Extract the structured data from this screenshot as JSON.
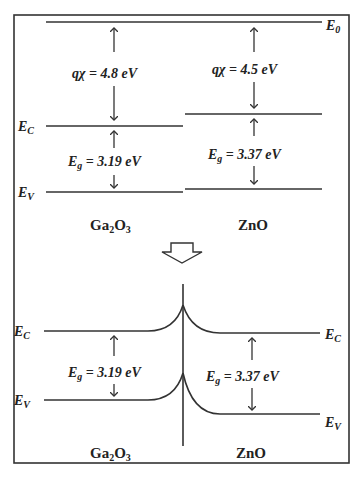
{
  "figure": {
    "type": "energy band diagram",
    "top_panel": {
      "vacuum_level_label": "E",
      "vacuum_level_sub": "0",
      "left_material": {
        "name_main": "Ga",
        "name_sub1": "2",
        "name_mid": "O",
        "name_sub2": "3",
        "electron_affinity_label": "qχ = 4.8 eV",
        "bandgap_label_E": "E",
        "bandgap_label_sub": "g",
        "bandgap_value": " = 3.19 eV",
        "ec_label": "E",
        "ec_sub": "C",
        "ev_label": "E",
        "ev_sub": "V"
      },
      "right_material": {
        "name": "ZnO",
        "electron_affinity_label": "qχ = 4.5 eV",
        "bandgap_label_E": "E",
        "bandgap_label_sub": "g",
        "bandgap_value": " = 3.37 eV"
      }
    },
    "transition_arrow": "down-arrow",
    "bottom_panel": {
      "left_material": {
        "name_main": "Ga",
        "name_sub1": "2",
        "name_mid": "O",
        "name_sub2": "3",
        "bandgap_label_E": "E",
        "bandgap_label_sub": "g",
        "bandgap_value": " = 3.19 eV",
        "ec_label": "E",
        "ec_sub": "C",
        "ev_label": "E",
        "ev_sub": "V"
      },
      "right_material": {
        "name": "ZnO",
        "bandgap_label_E": "E",
        "bandgap_label_sub": "g",
        "bandgap_value": " = 3.37 eV",
        "ec_label": "E",
        "ec_sub": "C",
        "ev_label": "E",
        "ev_sub": "V"
      }
    }
  }
}
